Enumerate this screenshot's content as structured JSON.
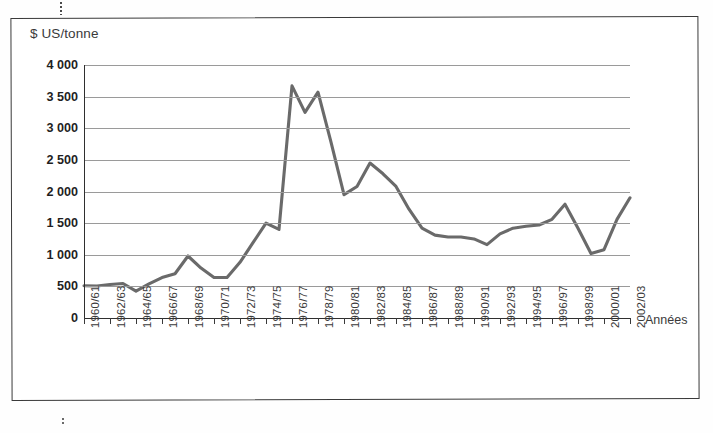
{
  "figure": {
    "ylabel": "$ US/tonne",
    "xlabel": "Années",
    "line_color": "#6a6a6a",
    "grid_color": "#9a9a9a",
    "axis_color": "#2f2f2f"
  },
  "chart_data": {
    "type": "line",
    "title": "",
    "subtitle": "",
    "xlabel": "Années",
    "ylabel": "$ US/tonne",
    "ylim": [
      0,
      4000
    ],
    "ytick_values": [
      0,
      500,
      1000,
      1500,
      2000,
      2500,
      3000,
      3500,
      4000
    ],
    "ytick_labels": [
      "0",
      "500",
      "1 000",
      "1 500",
      "2 000",
      "2 500",
      "3 000",
      "3 500",
      "4 000"
    ],
    "grid": "horizontal",
    "legend": "none",
    "markers": "none",
    "x_tick_labels": [
      "1960/61",
      "1962/63",
      "1964/65",
      "1966/67",
      "1968/69",
      "1970/71",
      "1972/73",
      "1974/75",
      "1976/77",
      "1978/79",
      "1980/81",
      "1982/83",
      "1984/85",
      "1986/87",
      "1988/89",
      "1990/91",
      "1992/93",
      "1994/95",
      "1996/97",
      "1998/99",
      "2000/01",
      "2002/03"
    ],
    "x_tick_label_interval_years": 2,
    "x": [
      "1960/61",
      "1961/62",
      "1962/63",
      "1963/64",
      "1964/65",
      "1965/66",
      "1966/67",
      "1967/68",
      "1968/69",
      "1969/70",
      "1970/71",
      "1971/72",
      "1972/73",
      "1973/74",
      "1974/75",
      "1975/76",
      "1976/77",
      "1977/78",
      "1978/79",
      "1979/80",
      "1980/81",
      "1981/82",
      "1982/83",
      "1983/84",
      "1984/85",
      "1985/86",
      "1986/87",
      "1987/88",
      "1988/89",
      "1989/90",
      "1990/91",
      "1991/92",
      "1992/93",
      "1993/94",
      "1994/95",
      "1995/96",
      "1996/97",
      "1997/98",
      "1998/99",
      "1999/00",
      "2000/01",
      "2001/02",
      "2002/03"
    ],
    "series": [
      {
        "name": "Prix",
        "values": [
          510,
          505,
          530,
          545,
          425,
          540,
          640,
          700,
          980,
          790,
          640,
          640,
          880,
          1190,
          1500,
          1400,
          3670,
          3250,
          3570,
          2780,
          1950,
          2080,
          2450,
          2280,
          2080,
          1720,
          1420,
          1310,
          1280,
          1280,
          1250,
          1160,
          1330,
          1420,
          1450,
          1470,
          1560,
          1800,
          1420,
          1020,
          1080,
          1560,
          1900
        ]
      }
    ]
  }
}
